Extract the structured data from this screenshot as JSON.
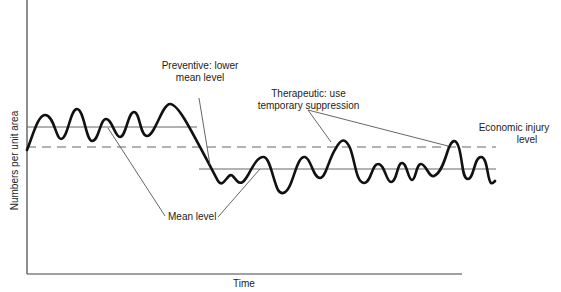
{
  "figure": {
    "y_axis_label": "Numbers per unit area",
    "x_axis_label": "Time",
    "annotations": {
      "preventive": [
        "Preventive: lower",
        "mean level"
      ],
      "therapeutic": [
        "Therapeutic:  use",
        "temporary suppression"
      ],
      "economic_injury": [
        "Economic injury",
        "level"
      ],
      "mean_level": "Mean level"
    },
    "lines": {
      "economic_injury_level": {
        "style": "dashed",
        "y": 147
      },
      "upper_mean_level": {
        "style": "thin-solid",
        "y": 127
      },
      "lower_mean_level": {
        "style": "thin-solid",
        "y": 169
      }
    },
    "colors": {
      "curve": "#111111",
      "lines": "#555555",
      "background": "#ffffff"
    }
  }
}
